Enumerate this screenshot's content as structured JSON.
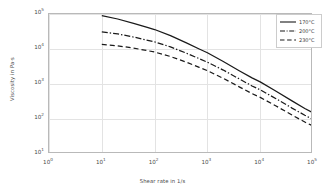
{
  "chart_data": {
    "type": "line",
    "title": "",
    "xlabel": "Shear rate in 1/s",
    "ylabel": "Viscosity in Pa·s",
    "xscale": "log",
    "yscale": "log",
    "xlim": [
      1,
      100000
    ],
    "ylim": [
      10,
      100000
    ],
    "xticks": [
      "10⁰",
      "10¹",
      "10²",
      "10³",
      "10⁴",
      "10⁵"
    ],
    "xtick_values": [
      1,
      10,
      100,
      1000,
      10000,
      100000
    ],
    "yticks": [
      "10¹",
      "10²",
      "10³",
      "10⁴",
      "10⁵"
    ],
    "ytick_values": [
      10,
      100,
      1000,
      10000,
      100000
    ],
    "grid": true,
    "legend_position": "upper right",
    "series": [
      {
        "name": "170°C",
        "linestyle": "solid",
        "color": "#1a1a1a",
        "x": [
          10,
          20,
          40,
          70,
          100,
          200,
          400,
          700,
          1000,
          2000,
          4000,
          7000,
          10000,
          20000,
          40000,
          70000,
          100000
        ],
        "y": [
          90000,
          72000,
          54000,
          42000,
          36000,
          24000,
          15000,
          10000,
          7800,
          4400,
          2400,
          1500,
          1150,
          620,
          330,
          200,
          150
        ]
      },
      {
        "name": "200°C",
        "linestyle": "dashdot",
        "color": "#1a1a1a",
        "x": [
          10,
          20,
          40,
          70,
          100,
          200,
          400,
          700,
          1000,
          2000,
          4000,
          7000,
          10000,
          20000,
          40000,
          70000,
          100000
        ],
        "y": [
          31000,
          27000,
          22000,
          18000,
          16000,
          11500,
          7600,
          5300,
          4200,
          2500,
          1400,
          880,
          680,
          380,
          205,
          128,
          97
        ]
      },
      {
        "name": "230°C",
        "linestyle": "dashed",
        "color": "#1a1a1a",
        "x": [
          10,
          20,
          40,
          70,
          100,
          200,
          400,
          700,
          1000,
          2000,
          4000,
          7000,
          10000,
          20000,
          40000,
          70000,
          100000
        ],
        "y": [
          13500,
          12300,
          10600,
          9100,
          8200,
          6100,
          4200,
          3000,
          2400,
          1450,
          830,
          530,
          415,
          235,
          130,
          82,
          63
        ]
      }
    ]
  },
  "legend": {
    "items": [
      {
        "label": "170°C"
      },
      {
        "label": "200°C"
      },
      {
        "label": "230°C"
      }
    ]
  },
  "axis_titles": {
    "x": "Shear rate in 1/s",
    "y": "Viscosity in Pa·s"
  },
  "colors": {
    "line": "#1a1a1a",
    "grid": "#e3e3e3",
    "frame": "#b9b9b9",
    "text": "#4a4a4a",
    "background": "#ffffff"
  }
}
